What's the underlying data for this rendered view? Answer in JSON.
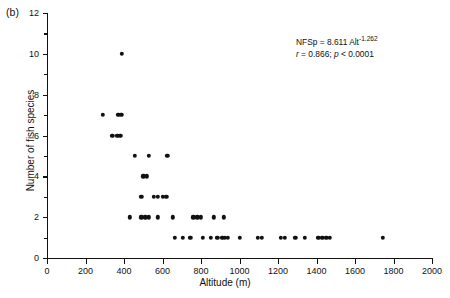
{
  "panel": {
    "label": "(b)"
  },
  "annotation": {
    "equation_prefix": "NFSp = 8.611 Alt",
    "equation_exponent": "-1.262",
    "stats_r": "r",
    "stats_r_value": " = 0.866; ",
    "stats_p": "p",
    "stats_p_value": " < 0.0001"
  },
  "chart_data": {
    "type": "scatter",
    "title": "",
    "xlabel": "Altitude (m)",
    "ylabel": "Number of fish species",
    "xlim": [
      0,
      2000
    ],
    "ylim": [
      0,
      12
    ],
    "xticks": [
      0,
      200,
      400,
      600,
      800,
      1000,
      1200,
      1400,
      1600,
      1800,
      2000
    ],
    "yticks": [
      0,
      2,
      4,
      6,
      8,
      10,
      12
    ],
    "yminorticks": [
      1,
      3,
      5,
      7,
      9,
      11
    ],
    "xtick_labels": [
      "0",
      "200",
      "400",
      "600",
      "800",
      "1000",
      "1200",
      "1400",
      "1600",
      "1800",
      "2000"
    ],
    "ytick_labels": [
      "0",
      "2",
      "4",
      "6",
      "8",
      "10",
      "12"
    ],
    "grid": false,
    "legend": null,
    "marker": "filled-circle",
    "marker_color": "#111111",
    "points": [
      [
        390,
        10
      ],
      [
        290,
        7
      ],
      [
        370,
        7
      ],
      [
        385,
        7
      ],
      [
        340,
        6
      ],
      [
        365,
        6
      ],
      [
        380,
        6
      ],
      [
        455,
        5
      ],
      [
        530,
        5
      ],
      [
        625,
        5
      ],
      [
        500,
        4
      ],
      [
        520,
        4
      ],
      [
        555,
        3
      ],
      [
        575,
        3
      ],
      [
        490,
        3
      ],
      [
        600,
        3
      ],
      [
        620,
        3
      ],
      [
        430,
        2
      ],
      [
        490,
        2
      ],
      [
        510,
        2
      ],
      [
        530,
        2
      ],
      [
        575,
        2
      ],
      [
        655,
        2
      ],
      [
        760,
        2
      ],
      [
        780,
        2
      ],
      [
        800,
        2
      ],
      [
        865,
        2
      ],
      [
        920,
        2
      ],
      [
        665,
        1
      ],
      [
        705,
        1
      ],
      [
        745,
        1
      ],
      [
        810,
        1
      ],
      [
        850,
        1
      ],
      [
        885,
        1
      ],
      [
        910,
        1
      ],
      [
        925,
        1
      ],
      [
        940,
        1
      ],
      [
        1000,
        1
      ],
      [
        1095,
        1
      ],
      [
        1115,
        1
      ],
      [
        1215,
        1
      ],
      [
        1235,
        1
      ],
      [
        1290,
        1
      ],
      [
        1340,
        1
      ],
      [
        1410,
        1
      ],
      [
        1430,
        1
      ],
      [
        1450,
        1
      ],
      [
        1470,
        1
      ],
      [
        1745,
        1
      ]
    ],
    "annotations": [
      "NFSp = 8.611 Alt^-1.262",
      "r = 0.866; p < 0.0001"
    ]
  }
}
